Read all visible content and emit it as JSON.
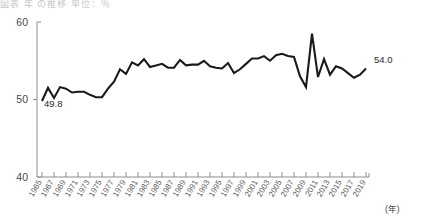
{
  "header": {
    "cut_off_caption": "図表  年  の推移   単位：％"
  },
  "chart_data": {
    "type": "line",
    "title": "",
    "xlabel": "(年)",
    "ylabel": "",
    "ylim": [
      40,
      60
    ],
    "yticks": [
      40,
      50,
      60
    ],
    "ytick_labels": [
      "40",
      "50",
      "60"
    ],
    "grid": false,
    "legend": "none",
    "x_start": 1965,
    "x_end": 2019,
    "xtick_labels": [
      "1965",
      "1967",
      "1969",
      "1971",
      "1973",
      "1975",
      "1977",
      "1979",
      "1981",
      "1983",
      "1985",
      "1987",
      "1989",
      "1991",
      "1993",
      "1995",
      "1997",
      "1999",
      "2001",
      "2003",
      "2005",
      "2007",
      "2009",
      "2011",
      "2013",
      "2015",
      "2017",
      "2019"
    ],
    "annotations": [
      {
        "name": "start-value",
        "text": "49.8",
        "x": 1965,
        "y": 49.8
      },
      {
        "name": "end-value",
        "text": "54.0",
        "x": 2019,
        "y": 54.0
      }
    ],
    "x": [
      1965,
      1966,
      1967,
      1968,
      1969,
      1970,
      1971,
      1972,
      1973,
      1974,
      1975,
      1976,
      1977,
      1978,
      1979,
      1980,
      1981,
      1982,
      1983,
      1984,
      1985,
      1986,
      1987,
      1988,
      1989,
      1990,
      1991,
      1992,
      1993,
      1994,
      1995,
      1996,
      1997,
      1998,
      1999,
      2000,
      2001,
      2002,
      2003,
      2004,
      2005,
      2006,
      2007,
      2008,
      2009,
      2010,
      2011,
      2012,
      2013,
      2014,
      2015,
      2016,
      2017,
      2018,
      2019
    ],
    "values": [
      49.8,
      51.5,
      50.2,
      51.6,
      51.4,
      50.9,
      51.0,
      51.0,
      50.6,
      50.3,
      50.3,
      51.4,
      52.3,
      53.9,
      53.3,
      54.8,
      54.4,
      55.2,
      54.2,
      54.4,
      54.6,
      54.1,
      54.1,
      55.1,
      54.4,
      54.5,
      54.5,
      55.0,
      54.3,
      54.1,
      54.0,
      54.7,
      53.4,
      53.9,
      54.6,
      55.3,
      55.3,
      55.6,
      55.0,
      55.7,
      55.9,
      55.6,
      55.5,
      53.0,
      51.6,
      58.5,
      52.9,
      55.2,
      53.2,
      54.3,
      54.0,
      53.4,
      52.8,
      53.2,
      54.0
    ]
  }
}
